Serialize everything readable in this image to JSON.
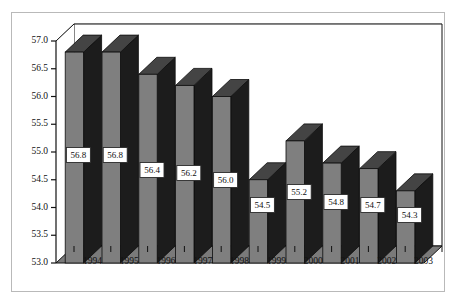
{
  "figure": {
    "background_color": "#ffffff",
    "frame_color": "#b9b9b9"
  },
  "chart_data": {
    "type": "bar",
    "title": "",
    "subtitle": "",
    "xlabel": "",
    "ylabel": "",
    "categories": [
      "1994",
      "1995",
      "1996",
      "1997",
      "1998",
      "1999",
      "2000",
      "2001",
      "2002",
      "2003"
    ],
    "values": [
      56.8,
      56.8,
      56.4,
      56.2,
      56.0,
      54.5,
      55.2,
      54.8,
      54.7,
      54.3
    ],
    "data_labels": [
      "56.8",
      "56.8",
      "56.4",
      "56.2",
      "56.0",
      "54.5",
      "55.2",
      "54.8",
      "54.7",
      "54.3"
    ],
    "ylim": [
      53.0,
      57.0
    ],
    "ytick_values": [
      53.0,
      53.5,
      54.0,
      54.5,
      55.0,
      55.5,
      56.0,
      56.5,
      57.0
    ],
    "ytick_labels": [
      "53.0",
      "53.5",
      "54.0",
      "54.5",
      "55.0",
      "55.5",
      "56.0",
      "56.5",
      "57.0"
    ],
    "grid": true,
    "grid_axis": "y",
    "legend": false,
    "legend_position": "none",
    "three_d": true,
    "bar_face_color": "#7f7f7f",
    "bar_side_color": "#1c1c1c",
    "bar_top_color": "#444444",
    "floor_color": "#7a7a7a",
    "gridline_color": "#9a9a9a",
    "axis_color": "#111111",
    "datalabel_box_fill": "#ffffff",
    "datalabel_box_border": "#2a2a2a"
  },
  "axes": {
    "y_axis_name": "value-axis",
    "x_axis_name": "category-axis"
  }
}
